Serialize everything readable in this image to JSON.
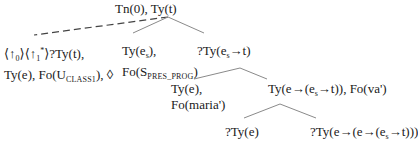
{
  "tree": {
    "root": {
      "label": "Tn(0), Ty(t)"
    },
    "unfixed_node": {
      "line1": {
        "prefix": "⟨↑",
        "sub0": "0",
        "mid": "⟩⟨↑",
        "sub1": "1",
        "star": "*",
        "suffix": "⟩?Ty(t),"
      },
      "line2": {
        "prefix": "Ty(e), Fo(U",
        "subscript": "CLASS1",
        "suffix": "), ◊"
      }
    },
    "event_node": {
      "line1": {
        "prefix": "Ty(e",
        "subscript": "s",
        "suffix": "),"
      },
      "line2": {
        "prefix": "Fo(S",
        "subscript": "PRES_PROG",
        "suffix": ")"
      }
    },
    "pred_node": {
      "prefix": "?Ty(e",
      "subscript": "s",
      "suffix": "→t)"
    },
    "subject_node": {
      "line1": "Ty(e),",
      "line2": "Fo(maria')"
    },
    "functor_node": {
      "prefix": "Ty(e→(e",
      "subscript": "s",
      "suffix": "→t)), Fo(va')"
    },
    "object_node": {
      "label": "?Ty(e)"
    },
    "verb_node": {
      "prefix": "?Ty(e→(e→(e",
      "subscript": "s",
      "suffix": "→t)))"
    }
  },
  "colors": {
    "text": "#1a1a1a",
    "edge": "#8a8a8a",
    "dashed_edge": "#444444"
  }
}
